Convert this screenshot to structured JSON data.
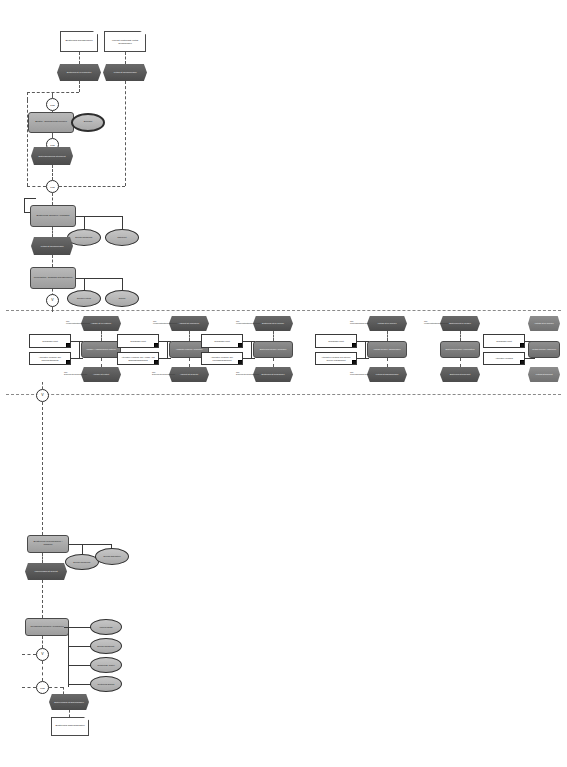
{
  "diagram": {
    "notation": "EPC",
    "operators": {
      "xor": "XOR",
      "or": "V",
      "and": "^"
    }
  },
  "top": {
    "start_events": [
      {
        "id": "se1",
        "label": "Bestellung durchfuehren"
      },
      {
        "id": "se2",
        "label": "Lieferant verstaendigt Vertrag abzuschliessen"
      }
    ],
    "events": [
      {
        "id": "e1",
        "label": "Bestellung ist zu bearbeiten"
      },
      {
        "id": "e2",
        "label": "Vertrag ist abzuschliessen"
      },
      {
        "id": "e3",
        "label": "Bestellanforderung ist geprueft"
      }
    ],
    "functions": [
      {
        "id": "f1",
        "label": "Bestell- anforderung pruefen"
      },
      {
        "id": "f2",
        "label": "Bestellung anlegen / erfassen"
      },
      {
        "id": "f3",
        "label": "Lieferanten- auswahl durchfuehren"
      }
    ],
    "orgs": [
      {
        "id": "o1",
        "label": "Einkauf"
      },
      {
        "id": "o2",
        "label": "Einkauf Sachbearb."
      },
      {
        "id": "o3",
        "label": "Disponent"
      },
      {
        "id": "o4",
        "label": "Einkauf Leitung"
      },
      {
        "id": "o5",
        "label": "Einkauf"
      }
    ]
  },
  "band": {
    "label": "Variantenband - Alternative Loesungen",
    "groups": [
      {
        "id": "g1",
        "event_top": {
          "label": "Anfrage ist zu erstellen",
          "prefix": "QM-Konformitaetsmanagement"
        },
        "function": {
          "label": "Anfrage / Ausschreibung erstellen"
        },
        "event_bottom": {
          "label": "Anfrage ist erstellt",
          "prefix": "QM-Dokumentenmanagement"
        },
        "data_in": {
          "label": "Grundlagen Input"
        },
        "data_alt": {
          "label": "Alternative Loesung: QM-Sicherheitsloesung"
        }
      },
      {
        "id": "g2",
        "event_top": {
          "label": "Angebot ist einzuholen",
          "prefix": "QM-Konformitaetsmanagement"
        },
        "function": {
          "label": "Angebote einholen / bewerten"
        },
        "event_bottom": {
          "label": "Angebot ist bewertet",
          "prefix": "QM-Dokumentenmanagement"
        },
        "data_in": {
          "label": "Grundlagen Input"
        },
        "data_alt": {
          "label": "Alternative Loesung: QM-Anlage- und Beschaffungsplanung"
        }
      },
      {
        "id": "g3",
        "event_top": {
          "label": "Bestellung ist zu pruefen",
          "prefix": "QM-Konformitaetsmanagement"
        },
        "function": {
          "label": "Bestellung pruefen / freigeben"
        },
        "event_bottom": {
          "label": "Bestellung ist freigegeben",
          "prefix": "QM-Dokumentenmanagement"
        },
        "data_in": {
          "label": "Grundlagen Input"
        },
        "data_alt": {
          "label": "Alternative Loesung: QM-Prozessmanagement"
        }
      },
      {
        "id": "g4",
        "event_top": {
          "label": "Vertrag ist zu pruefen",
          "prefix": "QM-Prozessmanagement"
        },
        "function": {
          "label": "Vertrag pruefen / abschliessen"
        },
        "event_bottom": {
          "label": "Vertrag ist abgeschlossen",
          "prefix": "QM-Prozessmanagement"
        },
        "data_in": {
          "label": "Grundlagen Input"
        },
        "data_alt": {
          "label": "Alternative Loesung: QM-Service Service-Management"
        }
      },
      {
        "id": "g5",
        "event_top": {
          "label": "Bestellung ist zu senden",
          "prefix": "QM-Konformitaetsmanagement"
        },
        "function": {
          "label": "Bestellung senden / uebermitteln"
        },
        "event_bottom": {
          "label": "Bestellung ist gesendet",
          "prefix": "QM-Dokumentenmanagement"
        },
        "data_in": {
          "label": "Grundlagen Input"
        },
        "data_alt": {
          "label": "Alternative Loesung: QM-Berichtsmanagement"
        }
      },
      {
        "id": "g6",
        "event_top": {
          "label": "Bestellung ist zu bestaetigen",
          "prefix": "QM"
        },
        "function": {
          "label": "Bestellung bestaetigen"
        },
        "event_bottom": {
          "label": "Bestellung ist bestaetigt",
          "prefix": "QM"
        },
        "data_in": {
          "label": "Grundlagen Input"
        },
        "data_alt": {
          "label": "Alternative Loesung"
        }
      }
    ],
    "right": {
      "data_in": {
        "label": "Grundlagen Input"
      },
      "data_alt": {
        "label": "Alternative Loesung"
      },
      "function": {
        "label": "Vertrag pruefen / abwickeln"
      },
      "event_top": {
        "label": "Vertrag ist zu pruefen"
      },
      "event_bottom": {
        "label": "Vertrag ist geprueft"
      },
      "extra_function": {
        "label": "Vertrag ueber- nehmen"
      },
      "extra_event": {
        "label": "Vertrag uebernommen"
      }
    }
  },
  "bottom": {
    "functions": [
      {
        "id": "bf1",
        "label": "Bestellung ueberwachen / mahnen"
      },
      {
        "id": "bf2",
        "label": "Wareneingang pruefen / buchen"
      },
      {
        "id": "bf3",
        "label": "Rechnung pruefen / freigeben"
      }
    ],
    "events": [
      {
        "id": "be1",
        "label": "Wareneingang ist gebucht"
      },
      {
        "id": "be2",
        "label": "Rechnung ist geprueft"
      },
      {
        "id": "be3",
        "label": "Bestellvorgang ist abgeschlossen"
      }
    ],
    "orgs": [
      {
        "id": "bo1",
        "label": "Einkauf Sachbearb."
      },
      {
        "id": "bo2",
        "label": "Einkauf Disposition"
      },
      {
        "id": "bo3",
        "label": "Wareneingang"
      },
      {
        "id": "bo4",
        "label": "Einkauf Sachbearb."
      },
      {
        "id": "bo5",
        "label": "Rechnungs- wesen"
      },
      {
        "id": "bo6",
        "label": "Controlling Einkauf"
      }
    ],
    "end_note": {
      "label": "Bestellung abgeschlossen"
    }
  }
}
